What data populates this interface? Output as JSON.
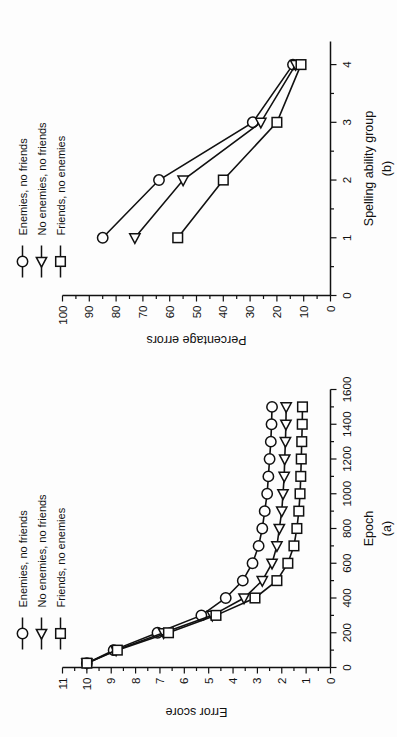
{
  "figure": {
    "orientation": "rotated-90-ccw",
    "background": "#ffffff",
    "ink": "#111111"
  },
  "legend": {
    "entries": [
      {
        "marker": "circle-open-marker",
        "label": "Enemies, no friends"
      },
      {
        "marker": "triangle-open-marker",
        "label": "No enemies, no friends"
      },
      {
        "marker": "square-open-marker",
        "label": "Friends, no enemies"
      }
    ]
  },
  "chart_data": [
    {
      "id": "panel-a",
      "type": "line",
      "title": "",
      "panel_label": "(a)",
      "xlabel": "Epoch",
      "ylabel": "Error score",
      "xlim": [
        0,
        1600
      ],
      "ylim": [
        0,
        11
      ],
      "xticks": [
        0,
        200,
        400,
        600,
        800,
        1000,
        1200,
        1400,
        1600
      ],
      "xtick_labels": [
        "0",
        "200",
        "400",
        "600",
        "800",
        "1000",
        "1200",
        "1400",
        "1600"
      ],
      "yticks": [
        0,
        1,
        2,
        3,
        4,
        5,
        6,
        7,
        8,
        9,
        10,
        11
      ],
      "ytick_labels": [
        "0",
        "1",
        "2",
        "3",
        "4",
        "5",
        "6",
        "7",
        "8",
        "9",
        "10",
        "11"
      ],
      "grid": false,
      "legend_position": "top-left-outside",
      "x": [
        25,
        100,
        200,
        300,
        400,
        500,
        600,
        700,
        800,
        900,
        1000,
        1100,
        1200,
        1300,
        1400,
        1500
      ],
      "series": [
        {
          "name": "Enemies, no friends",
          "marker": "circle",
          "values": [
            10.0,
            8.9,
            7.1,
            5.3,
            4.3,
            3.6,
            3.2,
            2.95,
            2.8,
            2.7,
            2.6,
            2.55,
            2.5,
            2.45,
            2.42,
            2.4
          ]
        },
        {
          "name": "No enemies, no friends",
          "marker": "triangle",
          "values": [
            10.0,
            8.8,
            6.85,
            4.85,
            3.55,
            2.8,
            2.4,
            2.2,
            2.1,
            2.0,
            1.95,
            1.9,
            1.88,
            1.85,
            1.83,
            1.82
          ]
        },
        {
          "name": "Friends, no enemies",
          "marker": "square",
          "values": [
            10.0,
            8.75,
            6.65,
            4.7,
            3.1,
            2.2,
            1.75,
            1.5,
            1.38,
            1.3,
            1.25,
            1.22,
            1.2,
            1.18,
            1.16,
            1.15
          ]
        }
      ]
    },
    {
      "id": "panel-b",
      "type": "line",
      "title": "",
      "panel_label": "(b)",
      "xlabel": "Spelling ability group",
      "ylabel": "Percentage errors",
      "xlim": [
        0,
        4.4
      ],
      "ylim": [
        0,
        100
      ],
      "xticks": [
        0,
        1,
        2,
        3,
        4
      ],
      "xtick_labels": [
        "0",
        "1",
        "2",
        "3",
        "4"
      ],
      "yticks": [
        0,
        10,
        20,
        30,
        40,
        50,
        60,
        70,
        80,
        90,
        100
      ],
      "ytick_labels": [
        "0",
        "10",
        "20",
        "30",
        "40",
        "50",
        "60",
        "70",
        "80",
        "90",
        "100"
      ],
      "grid": false,
      "legend_position": "top-left-outside",
      "categories": [
        1,
        2,
        3,
        4
      ],
      "series": [
        {
          "name": "Enemies, no friends",
          "marker": "circle",
          "values": [
            85,
            64,
            29,
            14
          ]
        },
        {
          "name": "No enemies, no friends",
          "marker": "triangle",
          "values": [
            73,
            55,
            26,
            13
          ]
        },
        {
          "name": "Friends, no enemies",
          "marker": "square",
          "values": [
            57,
            40,
            20,
            11
          ]
        }
      ]
    }
  ]
}
